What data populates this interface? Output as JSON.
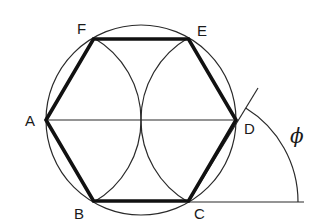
{
  "diagram": {
    "type": "geometric-construction",
    "labels": {
      "A": "A",
      "B": "B",
      "C": "C",
      "D": "D",
      "E": "E",
      "F": "F",
      "angle": "ϕ"
    },
    "colors": {
      "line": "#111111",
      "background": "#ffffff"
    }
  }
}
